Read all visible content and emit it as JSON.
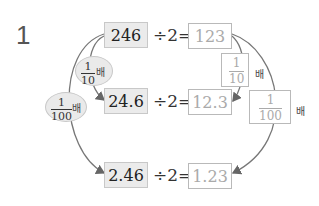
{
  "problem_number": "1",
  "rows": [
    {
      "given": "246",
      "operator": "÷2=",
      "answer": "123"
    },
    {
      "given": "24.6",
      "operator": "÷2=",
      "answer": "12.3"
    },
    {
      "given": "2.46",
      "operator": "÷2=",
      "answer": "1.23"
    }
  ],
  "left_labels": [
    {
      "numerator": "1",
      "denominator": "10",
      "suffix": "배"
    },
    {
      "numerator": "1",
      "denominator": "100",
      "suffix": "배"
    }
  ],
  "right_labels": [
    {
      "numerator": "1",
      "denominator": "10",
      "suffix": "배"
    },
    {
      "numerator": "1",
      "denominator": "100",
      "suffix": "배"
    }
  ]
}
